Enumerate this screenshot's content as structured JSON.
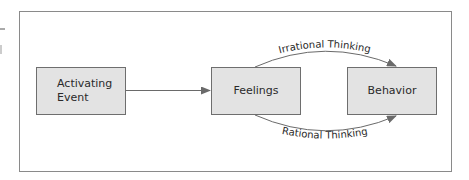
{
  "diagram": {
    "nodes": [
      {
        "id": "activating-event",
        "lines": [
          "Activating",
          "Event"
        ]
      },
      {
        "id": "feelings",
        "lines": [
          "Feelings"
        ]
      },
      {
        "id": "behavior",
        "lines": [
          "Behavior"
        ]
      }
    ],
    "edges": [
      {
        "from": "activating-event",
        "to": "feelings",
        "label": ""
      },
      {
        "from": "feelings",
        "to": "behavior",
        "label": "Irrational Thinking"
      },
      {
        "from": "feelings",
        "to": "behavior",
        "label": "Rational Thinking"
      }
    ],
    "colors": {
      "box_fill": "#e3e3e3",
      "box_stroke": "#6e6e6e",
      "frame_stroke": "#8a8a8a",
      "line": "#6a6a6a",
      "text": "#2a2a2a"
    }
  }
}
